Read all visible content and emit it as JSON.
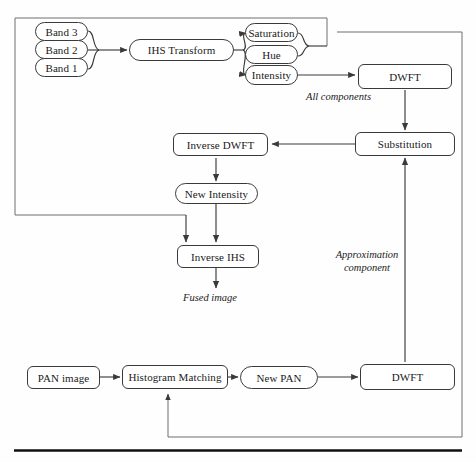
{
  "diagram": {
    "stroke_color": "#3a3a3a",
    "background": "#fefefe"
  },
  "nodes": {
    "band3": {
      "label": "Band 3"
    },
    "band2": {
      "label": "Band 2"
    },
    "band1": {
      "label": "Band 1"
    },
    "ihs_transform": {
      "label": "IHS Transform"
    },
    "saturation": {
      "label": "Saturation"
    },
    "hue": {
      "label": "Hue"
    },
    "intensity": {
      "label": "Intensity"
    },
    "dwft_top": {
      "label": "DWFT"
    },
    "substitution": {
      "label": "Substitution"
    },
    "inverse_dwft": {
      "label": "Inverse DWFT"
    },
    "new_intensity": {
      "label": "New Intensity"
    },
    "inverse_ihs": {
      "label": "Inverse IHS"
    },
    "pan_image": {
      "label": "PAN image"
    },
    "histogram_matching": {
      "label": "Histogram Matching"
    },
    "new_pan": {
      "label": "New PAN"
    },
    "dwft_bottom": {
      "label": "DWFT"
    }
  },
  "annotations": {
    "all_components": {
      "label": "All components"
    },
    "approximation_component": {
      "label": "Approximation component"
    },
    "fused_image": {
      "label": "Fused image"
    }
  }
}
